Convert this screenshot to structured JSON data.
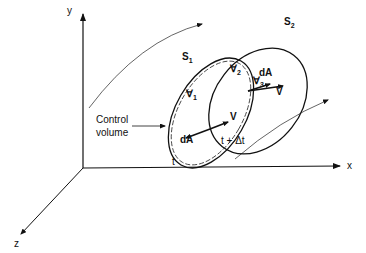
{
  "diagram": {
    "axes": {
      "x": "x",
      "y": "y",
      "z": "z"
    },
    "surfaces": {
      "s1": "S",
      "s1_sub": "1",
      "s2": "S",
      "s2_sub": "2"
    },
    "volumes": {
      "v1": "∀",
      "v1_sub": "1",
      "v2": "∀",
      "v2_sub": "2",
      "v3": "∀",
      "v3_sub": "3"
    },
    "vectors": {
      "dA_left": "dA",
      "V_left": "V",
      "dA_right": "dA",
      "V_right": "V"
    },
    "times": {
      "t": "t",
      "t_dt": "t + Δt"
    },
    "control_volume_label": {
      "line1": "Control",
      "line2": "volume"
    }
  }
}
